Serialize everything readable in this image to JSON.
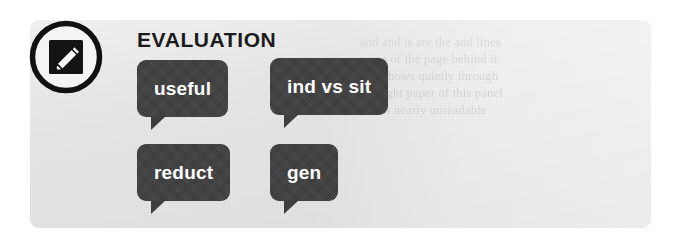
{
  "panel": {
    "heading": "EVALUATION",
    "background_color": "#e8e8e8",
    "bubble_color": "#3e3e3e",
    "bubble_text_color": "#fdfdfd",
    "heading_color": "#1b1b1b"
  },
  "icon": {
    "name": "notepad-pencil-icon",
    "description": "circle outline containing dark document with white pencil"
  },
  "bubbles": [
    {
      "label": "useful",
      "row": 1,
      "column": 1
    },
    {
      "label": "ind vs sit",
      "row": 1,
      "column": 2
    },
    {
      "label": "reduct",
      "row": 2,
      "column": 1
    },
    {
      "label": "gen",
      "row": 2,
      "column": 2
    }
  ],
  "ghost_text": "and and is are the and lines\nsome of the page behind it\ntext shows quietly through\nthe light paper of this panel\nand is nearly unreadable"
}
